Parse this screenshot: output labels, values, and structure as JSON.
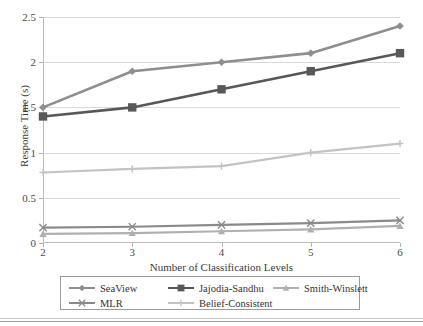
{
  "chart_data": {
    "type": "line",
    "title": "",
    "xlabel": "Number of Classification Levels",
    "ylabel": "Response Time (s)",
    "x": [
      2,
      3,
      4,
      5,
      6
    ],
    "xtick_labels": [
      "2",
      "3",
      "4",
      "5",
      "6"
    ],
    "ytick_labels": [
      "0",
      "0.5",
      "1",
      "1.5",
      "2",
      "2.5"
    ],
    "ytick_values": [
      0,
      0.5,
      1,
      1.5,
      2,
      2.5
    ],
    "xlim": [
      2,
      6
    ],
    "ylim": [
      0,
      2.5
    ],
    "grid": "horizontal",
    "legend_position": "bottom",
    "series": [
      {
        "name": "SeaView",
        "marker": "diamond",
        "color": "#8e8e8e",
        "values": [
          1.5,
          1.9,
          2.0,
          2.1,
          2.4
        ]
      },
      {
        "name": "Jajodia-Sandhu",
        "marker": "square",
        "color": "#585858",
        "values": [
          1.4,
          1.5,
          1.7,
          1.9,
          2.1
        ]
      },
      {
        "name": "Smith-Winslett",
        "marker": "triangle",
        "color": "#b0b0b0",
        "values": [
          0.1,
          0.11,
          0.13,
          0.15,
          0.19
        ]
      },
      {
        "name": "MLR",
        "marker": "cross-x",
        "color": "#8a8a8a",
        "values": [
          0.17,
          0.18,
          0.2,
          0.22,
          0.25
        ]
      },
      {
        "name": "Belief-Consistent",
        "marker": "plus",
        "color": "#c3c3c3",
        "values": [
          0.78,
          0.82,
          0.85,
          1.0,
          1.1
        ]
      }
    ]
  },
  "legend": {
    "entries": [
      {
        "label": "SeaView"
      },
      {
        "label": "Jajodia-Sandhu"
      },
      {
        "label": "Smith-Winslett"
      },
      {
        "label": "MLR"
      },
      {
        "label": "Belief-Consistent"
      }
    ]
  },
  "colors": {
    "grid": "#d9d9d9",
    "axis": "#bdbdbd",
    "text": "#3b3b3b",
    "legend_border": "#9a9a9a"
  }
}
